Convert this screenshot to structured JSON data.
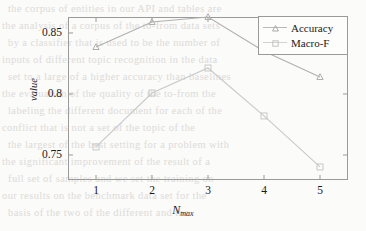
{
  "chart_data": {
    "type": "line",
    "title": "",
    "xlabel": "N_max",
    "xlabel_base": "N",
    "xlabel_sub": "max",
    "ylabel": "value",
    "x": [
      1,
      2,
      3,
      4,
      5
    ],
    "xticklabels": [
      "1",
      "2",
      "3",
      "4",
      "5"
    ],
    "yticks": [
      0.75,
      0.8,
      0.85
    ],
    "yticklabels": [
      "0.75",
      "0.8",
      "0.85"
    ],
    "xlim": [
      0.5,
      5.5
    ],
    "ylim": [
      0.7295,
      0.8631
    ],
    "grid": false,
    "legend_position": "top-right",
    "series": [
      {
        "name": "Accuracy",
        "marker": "triangle",
        "color": "#b0b0b0",
        "values": [
          0.8385,
          0.859,
          0.8631,
          0.835,
          0.8139
        ]
      },
      {
        "name": "Macro-F",
        "marker": "square",
        "color": "#c9c9c9",
        "values": [
          0.7566,
          0.8008,
          0.8213,
          0.782,
          0.7402
        ]
      }
    ]
  },
  "legend": {
    "items": [
      {
        "label": "Accuracy",
        "marker": "triangle"
      },
      {
        "label": "Macro-F",
        "marker": "square"
      }
    ]
  },
  "background_text": {
    "lines": [
      "the corpus of entities in our API and tables are",
      "the analysis of a corpus of the to-from data sets",
      "by a classifier that is used to be the number of",
      "inputs of different topic recognition in the data",
      "set to a large of a higher accuracy than baselines",
      "the evaluation of the quality of the to-from the",
      "labeling the different document for each of the",
      "conflict that is not a set of the topic of the",
      "the largest of the best setting for a problem with",
      "the significant improvement of the result of a",
      "full set of samples and we set the training on",
      "our results on the benchmark data set for the",
      "basis of the two of the different and the"
    ]
  },
  "colors": {
    "accuracy": "#b0b0b0",
    "macro_f": "#c9c9c9",
    "axis": "#9a9a9a",
    "text": "#1a1a1a",
    "background": "#fbfbfa"
  }
}
